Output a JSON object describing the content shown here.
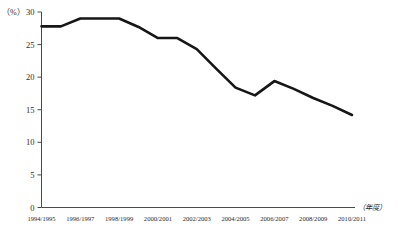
{
  "chart_data": {
    "type": "line",
    "title": "",
    "xlabel": "（年度）",
    "ylabel": "（%）",
    "categories": [
      "1994/1995",
      "1995/1996",
      "1996/1997",
      "1997/1998",
      "1998/1999",
      "1999/2000",
      "2000/2001",
      "2001/2002",
      "2002/2003",
      "2003/2004",
      "2004/2005",
      "2005/2006",
      "2006/2007",
      "2007/2008",
      "2008/2009",
      "2009/2010",
      "2010/2011"
    ],
    "values": [
      27.8,
      27.8,
      29.0,
      29.0,
      29.0,
      27.7,
      26.0,
      26.0,
      24.3,
      21.3,
      18.4,
      17.2,
      19.4,
      18.2,
      16.8,
      15.6,
      14.2
    ],
    "xtick_labels": [
      "1994/1995",
      "1996/1997",
      "1998/1999",
      "2000/2001",
      "2002/2003",
      "2004/2005",
      "2006/2007",
      "2008/2009",
      "2010/2011"
    ],
    "ytick_labels": [
      "0",
      "5",
      "10",
      "15",
      "20",
      "25",
      "30"
    ],
    "ytick_values": [
      0,
      5,
      10,
      15,
      20,
      25,
      30
    ],
    "ylim": [
      0,
      30
    ],
    "xlim": [
      0,
      16
    ],
    "grid": false,
    "legend": "none",
    "line_color": "#161616"
  }
}
